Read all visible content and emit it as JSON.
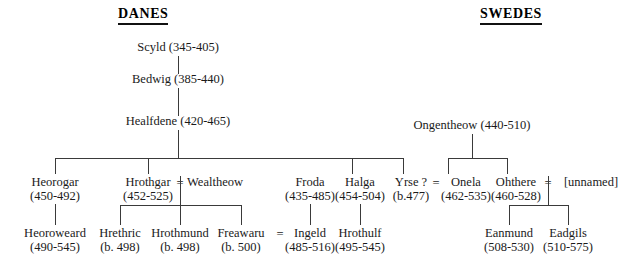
{
  "headings": {
    "danes": "DANES",
    "swedes": "SWEDES"
  },
  "symbols": {
    "marriage": "=",
    "uncertain": "?"
  },
  "people": {
    "scyld": {
      "name": "Scyld",
      "dates": "(345-405)"
    },
    "bedwig": {
      "name": "Bedwig",
      "dates": "(385-440)"
    },
    "healfdene": {
      "name": "Healfdene",
      "dates": "(420-465)"
    },
    "heorogar": {
      "name": "Heorogar",
      "dates": "(450-492)"
    },
    "hrothgar": {
      "name": "Hrothgar",
      "dates": "(452-525)"
    },
    "wealtheow": {
      "name": "Wealtheow",
      "dates": ""
    },
    "froda": {
      "name": "Froda",
      "dates": "(435-485)"
    },
    "halga": {
      "name": "Halga",
      "dates": "(454-504)"
    },
    "yrse": {
      "name": "Yrse ?",
      "dates": "(b.477)"
    },
    "onela": {
      "name": "Onela",
      "dates": "(462-535)"
    },
    "ohthere": {
      "name": "Ohthere",
      "dates": "(460-528)"
    },
    "unnamed": {
      "name": "[unnamed]",
      "dates": ""
    },
    "ongentheow": {
      "name": "Ongentheow",
      "dates": "(440-510)"
    },
    "heoroweard": {
      "name": "Heoroweard",
      "dates": "(490-545)"
    },
    "hrethric": {
      "name": "Hrethric",
      "dates": "(b. 498)"
    },
    "hrothmund": {
      "name": "Hrothmund",
      "dates": "(b. 498)"
    },
    "freawaru": {
      "name": "Freawaru",
      "dates": "(b. 500)"
    },
    "ingeld": {
      "name": "Ingeld",
      "dates": "(485-516)"
    },
    "hrothulf": {
      "name": "Hrothulf",
      "dates": "(495-545)"
    },
    "eanmund": {
      "name": "Eanmund",
      "dates": "(508-530)"
    },
    "eadgils": {
      "name": "Eadgils",
      "dates": "(510-575)"
    }
  },
  "colors": {
    "line": "#3a3a3a",
    "text": "#1a1a1a",
    "heading": "#000000",
    "background": "#ffffff"
  }
}
